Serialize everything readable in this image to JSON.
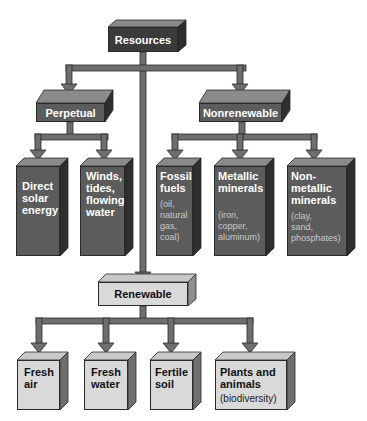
{
  "diagram": {
    "title": "Resources",
    "root": {
      "label": "Resources"
    },
    "categories": {
      "perpetual": {
        "label": "Perpetual",
        "children": [
          {
            "label": "Direct solar energy",
            "lines": [
              "Direct",
              "solar",
              "energy"
            ]
          },
          {
            "label": "Winds, tides, flowing water",
            "lines": [
              "Winds,",
              "tides,",
              "flowing",
              "water"
            ]
          }
        ]
      },
      "nonrenewable": {
        "label": "Nonrenewable",
        "children": [
          {
            "label": "Fossil fuels",
            "lines": [
              "Fossil",
              "fuels"
            ],
            "examples": [
              "(oil,",
              "natural",
              "gas,",
              "coal)"
            ]
          },
          {
            "label": "Metallic minerals",
            "lines": [
              "Metallic",
              "minerals"
            ],
            "examples": [
              "(iron,",
              "copper,",
              "aluminum)"
            ]
          },
          {
            "label": "Nonmetallic minerals",
            "lines": [
              "Non-",
              "metallic",
              "minerals"
            ],
            "examples": [
              "(clay,",
              "sand,",
              "phosphates)"
            ]
          }
        ]
      },
      "renewable": {
        "label": "Renewable",
        "children": [
          {
            "label": "Fresh air",
            "lines": [
              "Fresh",
              "air"
            ]
          },
          {
            "label": "Fresh water",
            "lines": [
              "Fresh",
              "water"
            ]
          },
          {
            "label": "Fertile soil",
            "lines": [
              "Fertile",
              "soil"
            ]
          },
          {
            "label": "Plants and animals",
            "lines": [
              "Plants and",
              "animals"
            ],
            "examples": [
              "(biodiversity)"
            ]
          }
        ]
      }
    },
    "colors": {
      "connector": "#6e6e6e",
      "connector_edge": "#2a2a2a",
      "root_fill": "#3b3b3b",
      "dark_fill": "#5c5c5c",
      "light_fill": "#d9d9d9",
      "top_face": "#8a8a8a",
      "side_face": "#2e2e2e"
    }
  }
}
